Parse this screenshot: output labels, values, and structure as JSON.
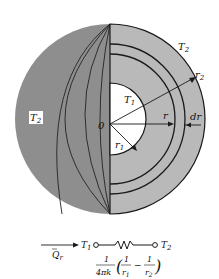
{
  "diagram": {
    "title": "",
    "sphere": {
      "center_label": "0",
      "inner_temp": "T",
      "inner_temp_sub": "1",
      "outer_temp": "T",
      "outer_temp_sub": "2",
      "left_temp": "T",
      "left_temp_sub": "2",
      "r_label": "r",
      "r1_label": "r",
      "r1_sub": "1",
      "r2_label": "r",
      "r2_sub": "2",
      "dr_label": "dr"
    },
    "circuit": {
      "flow_label": "Q",
      "flow_sub": "r",
      "node1_label": "T",
      "node1_sub": "1",
      "node2_label": "T",
      "node2_sub": "2",
      "resistance_numerator": "1",
      "resistance_denominator": "4πk",
      "frac1_num": "1",
      "frac1_den": "r",
      "frac1_den_sub": "1",
      "minus": "−",
      "frac2_num": "1",
      "frac2_den": "r",
      "frac2_den_sub": "2"
    },
    "colors": {
      "dark_shell": "#8e8e8e",
      "light_shell": "#b9b9b9",
      "inner_core": "#ffffff",
      "lines": "#1a1a1a"
    }
  }
}
